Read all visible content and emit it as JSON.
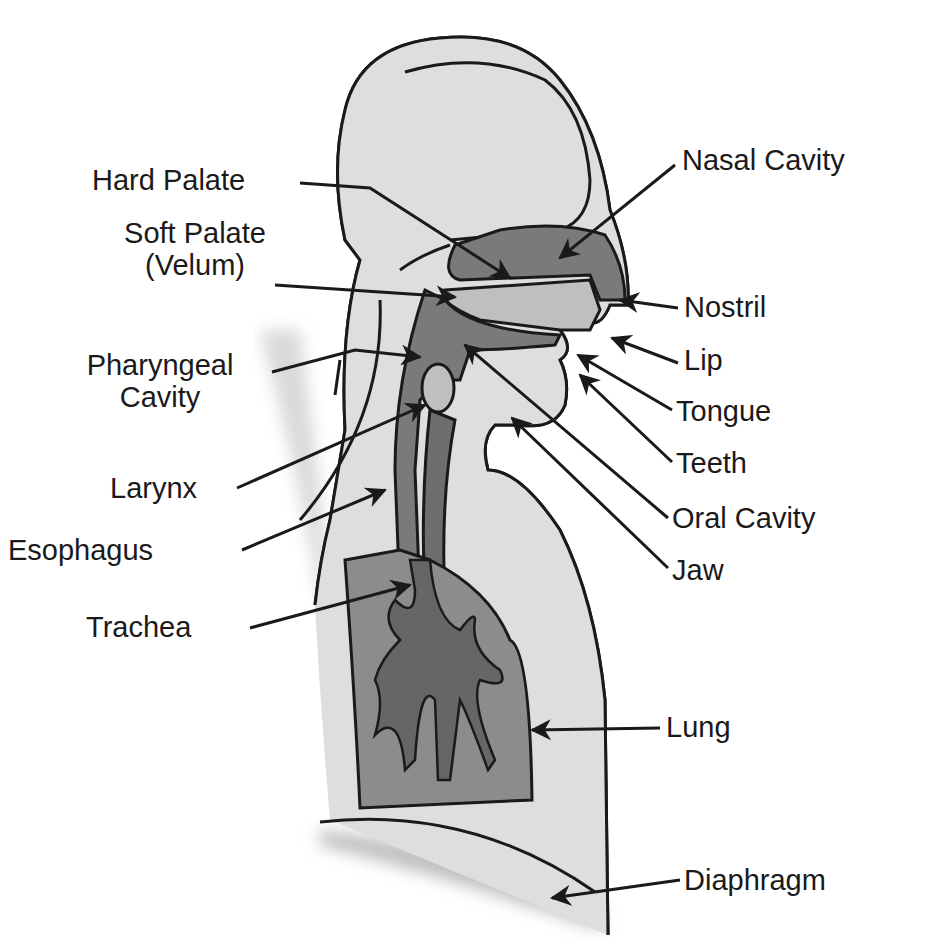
{
  "diagram": {
    "colors": {
      "body_fill": "#dedede",
      "cavity_fill": "#7a7a7a",
      "lung_fill": "#8c8c8c",
      "outline": "#1a1a1a",
      "label_text": "#1a1a1a"
    },
    "labels_left": {
      "hard_palate": "Hard Palate",
      "soft_palate_1": "Soft Palate",
      "soft_palate_2": "(Velum)",
      "pharyngeal_1": "Pharyngeal",
      "pharyngeal_2": "Cavity",
      "larynx": "Larynx",
      "esophagus": "Esophagus",
      "trachea": "Trachea"
    },
    "labels_right": {
      "nasal_cavity": "Nasal Cavity",
      "nostril": "Nostril",
      "lip": "Lip",
      "tongue": "Tongue",
      "teeth": "Teeth",
      "oral_cavity": "Oral Cavity",
      "jaw": "Jaw",
      "lung": "Lung",
      "diaphragm": "Diaphragm"
    }
  }
}
